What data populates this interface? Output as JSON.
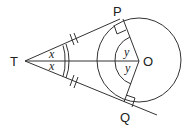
{
  "diagram": {
    "points": {
      "T": {
        "label": "T"
      },
      "P": {
        "label": "P"
      },
      "O": {
        "label": "O"
      },
      "Q": {
        "label": "Q"
      }
    },
    "angles": {
      "PTO": "x",
      "QTO": "x",
      "POT": "y",
      "QOT": "y"
    },
    "right_angles": [
      "OPT",
      "OQT"
    ],
    "equal_marks": [
      "TP",
      "TQ"
    ],
    "colors": {
      "stroke": "#333333",
      "background": "#ffffff"
    }
  }
}
